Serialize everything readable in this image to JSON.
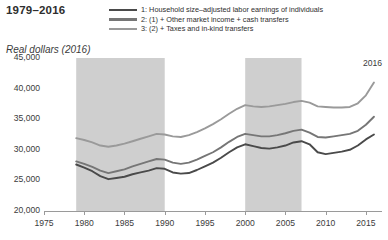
{
  "header": {
    "title": "1979–2016",
    "y_axis_title": "Real dollars (2016)",
    "end_note": "2016"
  },
  "legend": {
    "position": "top-center",
    "entries": [
      {
        "key": "1",
        "label": "1: Household size–adjusted labor earnings of individuals",
        "color": "#4a4a4a"
      },
      {
        "key": "2",
        "label": "2: (1) + Other market income + cash transfers",
        "color": "#767676"
      },
      {
        "key": "3",
        "label": "3: (2) + Taxes and in-kind transfers",
        "color": "#9a9a9a"
      }
    ]
  },
  "chart_data": {
    "type": "line",
    "title": "1979–2016",
    "xlabel": "",
    "ylabel": "Real dollars (2016)",
    "xlim": [
      1975,
      2017
    ],
    "ylim": [
      20000,
      45000
    ],
    "ytick_labels": [
      "20,000",
      "25,000",
      "30,000",
      "35,000",
      "40,000",
      "45,000"
    ],
    "yticks": [
      20000,
      25000,
      30000,
      35000,
      40000,
      45000
    ],
    "xtick_labels": [
      "1975",
      "1980",
      "1985",
      "1990",
      "1995",
      "2000",
      "2005",
      "2010",
      "2015"
    ],
    "xticks": [
      1975,
      1980,
      1985,
      1990,
      1995,
      2000,
      2005,
      2010,
      2015
    ],
    "grid": false,
    "shaded_bands": [
      {
        "label": "1979–1990",
        "x0": 1979,
        "x1": 1990,
        "color": "#cfcfcf"
      },
      {
        "label": "2000–2007",
        "x0": 2000,
        "x1": 2007,
        "color": "#cfcfcf"
      }
    ],
    "x": [
      1979,
      1980,
      1981,
      1982,
      1983,
      1984,
      1985,
      1986,
      1987,
      1988,
      1989,
      1990,
      1991,
      1992,
      1993,
      1994,
      1995,
      1996,
      1997,
      1998,
      1999,
      2000,
      2001,
      2002,
      2003,
      2004,
      2005,
      2006,
      2007,
      2008,
      2009,
      2010,
      2011,
      2012,
      2013,
      2014,
      2015,
      2016
    ],
    "series": [
      {
        "name": "1: Household size–adjusted labor earnings of individuals",
        "color": "#4a4a4a",
        "values": [
          27600,
          27100,
          26500,
          25700,
          25200,
          25400,
          25600,
          26000,
          26300,
          26600,
          27000,
          26900,
          26300,
          26100,
          26200,
          26700,
          27300,
          27900,
          28700,
          29600,
          30400,
          30900,
          30600,
          30300,
          30200,
          30400,
          30700,
          31200,
          31400,
          30900,
          29600,
          29300,
          29500,
          29700,
          30000,
          30700,
          31700,
          32500
        ]
      },
      {
        "name": "2: (1) + Other market income + cash transfers",
        "color": "#767676",
        "values": [
          28100,
          27700,
          27200,
          26600,
          26200,
          26500,
          26800,
          27300,
          27700,
          28100,
          28500,
          28400,
          27900,
          27700,
          27900,
          28400,
          29000,
          29600,
          30400,
          31300,
          32100,
          32600,
          32400,
          32200,
          32200,
          32400,
          32700,
          33100,
          33300,
          32800,
          32100,
          32000,
          32200,
          32400,
          32600,
          33100,
          34100,
          35400
        ]
      },
      {
        "name": "3: (2) + Taxes and in-kind transfers",
        "color": "#9a9a9a",
        "values": [
          31900,
          31600,
          31200,
          30700,
          30500,
          30700,
          31000,
          31400,
          31800,
          32200,
          32600,
          32500,
          32200,
          32100,
          32400,
          32900,
          33500,
          34200,
          35000,
          35900,
          36700,
          37300,
          37100,
          37000,
          37100,
          37300,
          37500,
          37800,
          38000,
          37700,
          37100,
          37000,
          36900,
          36900,
          37000,
          37600,
          38900,
          41000
        ]
      }
    ]
  }
}
